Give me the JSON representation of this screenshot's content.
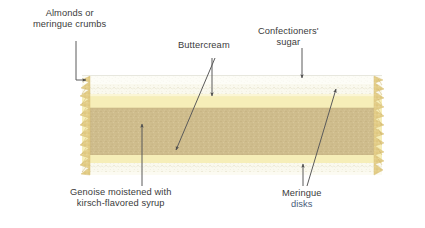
{
  "diagram": {
    "background_color": "#ffffff",
    "text_color": "#3b3b3b",
    "accent_text_color": "#4a5c7a"
  },
  "labels": {
    "almonds": {
      "line1": "Almonds or",
      "line2": "meringue crumbs"
    },
    "buttercream": {
      "line1": "Buttercream"
    },
    "sugar": {
      "line1": "Confectioners'",
      "line2": "sugar"
    },
    "genoise": {
      "line1": "Genoise moistened with",
      "line2": "kirsch-flavored syrup"
    },
    "meringue": {
      "line1": "Meringue",
      "line2": "disks"
    }
  },
  "cake_layers": [
    {
      "name": "confectioners-sugar-top",
      "label": "Confectioners' sugar",
      "color": "#fbfbf4"
    },
    {
      "name": "meringue-disk-top",
      "label": "Meringue disk",
      "color": "#f7f6ea"
    },
    {
      "name": "buttercream-upper",
      "label": "Buttercream",
      "color": "#f6eeb8"
    },
    {
      "name": "genoise",
      "label": "Genoise moistened with kirsch-flavored syrup",
      "color": "#cfbd8d"
    },
    {
      "name": "buttercream-lower",
      "label": "Buttercream",
      "color": "#f6eeb8"
    },
    {
      "name": "meringue-disk-bottom",
      "label": "Meringue disk",
      "color": "#f7f6ea"
    },
    {
      "name": "almond-crumb-edge",
      "label": "Almonds or meringue crumbs",
      "color": "#e6d28f"
    }
  ],
  "colors": {
    "genoise": "#cfbd8d",
    "buttercream": "#f6eeb8",
    "meringue": "#f8f7ec",
    "sugar": "#fcfcf6",
    "crumb_edge": "#e3cd87",
    "arrow": "#5a5a5a",
    "speckle": "#c9c2a0"
  }
}
